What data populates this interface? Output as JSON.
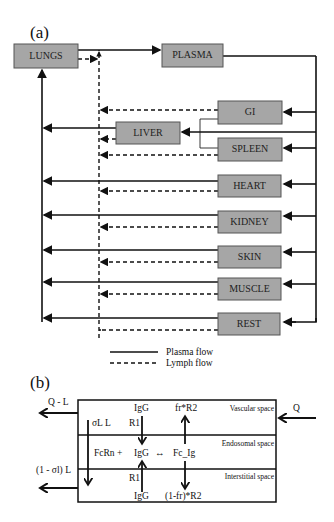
{
  "panel_a": {
    "label": "(a)",
    "organs": {
      "lungs": "LUNGS",
      "plasma": "PLASMA",
      "gi": "GI",
      "liver": "LIVER",
      "spleen": "SPLEEN",
      "heart": "HEART",
      "kidney": "KIDNEY",
      "skin": "SKIN",
      "muscle": "MUSCLE",
      "rest": "REST"
    },
    "legend": {
      "plasma_flow": "Plasma flow",
      "lymph_flow": "Lymph flow"
    }
  },
  "panel_b": {
    "label": "(b)",
    "spaces": {
      "vascular": "Vascular space",
      "endosomal": "Endosomal space",
      "interstitial": "Interstitial space"
    },
    "flows": {
      "q_minus_l": "Q - L",
      "q": "Q",
      "sigma_l_l": "σL L",
      "one_minus_sigma_l": "(1 - σl) L"
    },
    "species": {
      "igg_top": "IgG",
      "r1_top": "R1",
      "fr_r2": "fr*R2",
      "fcrn": "FcRn  +",
      "igg_mid": "IgG",
      "equilibrium": "↔",
      "fc_ig": "Fc_Ig",
      "r1_bottom": "R1",
      "igg_bottom": "IgG",
      "one_minus_fr_r2": "(1-fr)*R2"
    }
  }
}
